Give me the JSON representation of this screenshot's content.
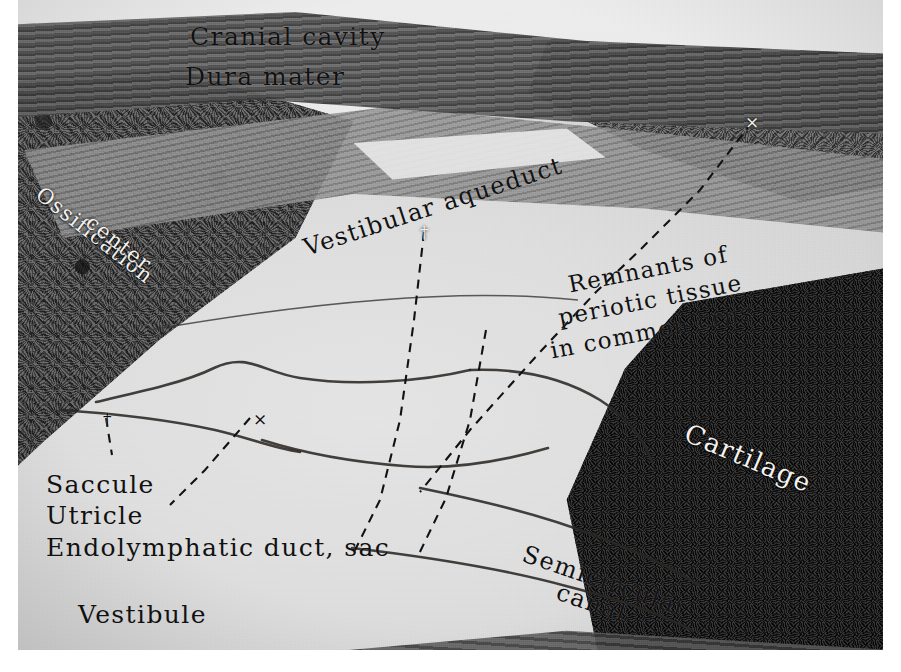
{
  "figure": {
    "kind": "histological-section-photomicrograph",
    "width": 901,
    "height": 672,
    "border_color": "#ffffff",
    "tone": "grayscale"
  },
  "labels": [
    {
      "id": "cranial-cavity",
      "text": "Cranial cavity",
      "x": 190,
      "y": 22,
      "rotate": 0,
      "size": 25,
      "color": "dark"
    },
    {
      "id": "dura-mater",
      "text": "Dura mater",
      "x": 185,
      "y": 62,
      "rotate": 0,
      "size": 25,
      "color": "dark"
    },
    {
      "id": "ossification-center-line1",
      "text": "Ossification",
      "x": 46,
      "y": 182,
      "rotate": 38,
      "size": 21,
      "color": "light"
    },
    {
      "id": "ossification-center-line2",
      "text": "center",
      "x": 96,
      "y": 210,
      "rotate": 38,
      "size": 21,
      "color": "light"
    },
    {
      "id": "vestibular-aqueduct",
      "text": "Vestibular aqueduct",
      "x": 300,
      "y": 235,
      "rotate": -18,
      "size": 24,
      "color": "dark"
    },
    {
      "id": "remnants-line1",
      "text": "Remnants of",
      "x": 566,
      "y": 272,
      "rotate": -11,
      "size": 23,
      "color": "dark"
    },
    {
      "id": "remnants-line2",
      "text": "periotic tissue",
      "x": 556,
      "y": 305,
      "rotate": -11,
      "size": 23,
      "color": "dark"
    },
    {
      "id": "remnants-line3",
      "text": "in common crus",
      "x": 548,
      "y": 338,
      "rotate": -11,
      "size": 23,
      "color": "dark"
    },
    {
      "id": "cartilage",
      "text": "Cartilage",
      "x": 692,
      "y": 418,
      "rotate": 23,
      "size": 26,
      "color": "light"
    },
    {
      "id": "saccule",
      "text": "Saccule",
      "x": 46,
      "y": 470,
      "rotate": 0,
      "size": 25,
      "color": "dark"
    },
    {
      "id": "utricle",
      "text": "Utricle",
      "x": 46,
      "y": 501,
      "rotate": 0,
      "size": 25,
      "color": "dark"
    },
    {
      "id": "endolymphatic-duct-sac",
      "text": "Endolymphatic duct, sac",
      "x": 46,
      "y": 533,
      "rotate": 0,
      "size": 25,
      "color": "dark"
    },
    {
      "id": "semicircular-line1",
      "text": "Semicircular",
      "x": 528,
      "y": 540,
      "rotate": 19,
      "size": 24,
      "color": "dark"
    },
    {
      "id": "semicircular-line2",
      "text": "canal",
      "x": 562,
      "y": 578,
      "rotate": 19,
      "size": 24,
      "color": "dark"
    },
    {
      "id": "vestibule",
      "text": "Vestibule",
      "x": 78,
      "y": 600,
      "rotate": 0,
      "size": 25,
      "color": "dark"
    }
  ],
  "markers": [
    {
      "id": "cross-remnants",
      "glyph": "×",
      "x": 745,
      "y": 112,
      "color": "light"
    },
    {
      "id": "dagger-aqueduct",
      "glyph": "†",
      "x": 420,
      "y": 222,
      "color": "light"
    },
    {
      "id": "dagger-saccule",
      "glyph": "†",
      "x": 103,
      "y": 409,
      "color": "dark"
    },
    {
      "id": "cross-utricle",
      "glyph": "×",
      "x": 253,
      "y": 409,
      "color": "dark"
    }
  ],
  "leaders": [
    {
      "id": "leader-remnants",
      "d": "M 752 122 L 700 190 L 640 250 L 596 292 L 540 352 L 470 430 L 420 492"
    },
    {
      "id": "leader-endolymphatic-duct",
      "d": "M 424 232 L 414 320 L 400 420 L 380 500 L 352 556"
    },
    {
      "id": "leader-endolymphatic-sac",
      "d": "M 486 330 L 470 420 L 446 498 L 418 556"
    },
    {
      "id": "leader-saccule",
      "d": "M 106 418 L 112 455"
    },
    {
      "id": "leader-utricle",
      "d": "M 250 418 L 205 470 L 170 505"
    }
  ],
  "membranes": [
    {
      "id": "utricle-wall",
      "d": "M 96 402 C 140 392 186 382 214 368 C 248 352 262 372 300 378 C 352 386 420 382 470 370"
    },
    {
      "id": "saccule-wall",
      "d": "M 60 410 C 120 414 170 420 215 430 C 250 438 272 448 300 452"
    },
    {
      "id": "endolymph-sac-wall",
      "d": "M 262 440 C 300 452 352 462 404 466 C 452 470 500 462 548 448"
    },
    {
      "id": "canal-upper-wall",
      "d": "M 420 488 C 478 500 540 514 596 536 C 644 554 676 570 700 586"
    },
    {
      "id": "canal-lower-wall",
      "d": "M 352 548 C 420 556 500 568 566 586 C 622 600 664 616 692 630"
    },
    {
      "id": "common-crus-wall",
      "d": "M 470 370 C 520 368 564 378 600 400 C 628 418 644 440 652 462"
    },
    {
      "id": "aqueduct-floor",
      "d": "M 150 330 C 220 318 300 306 380 300 C 452 294 520 294 578 300"
    }
  ]
}
